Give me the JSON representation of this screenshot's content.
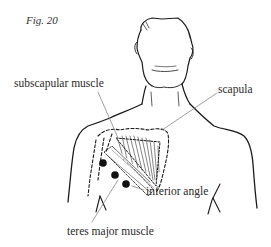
{
  "figure": {
    "label": "Fig. 20"
  },
  "annotations": [
    {
      "id": "subscapular-muscle",
      "text": "subscapular muscle"
    },
    {
      "id": "scapula",
      "text": "scapula"
    },
    {
      "id": "inferior-angle",
      "text": "inferior angle"
    },
    {
      "id": "teres-major-muscle",
      "text": "teres major muscle"
    }
  ],
  "colors": {
    "line": "#1a1a1a",
    "leader": "#777777",
    "text": "#2a2a2a",
    "background": "#ffffff"
  }
}
